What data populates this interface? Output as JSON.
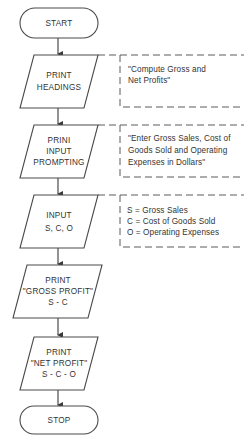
{
  "flowchart": {
    "nodes": [
      {
        "id": "start",
        "type": "terminal",
        "lines": [
          "START"
        ]
      },
      {
        "id": "print-headings",
        "type": "io",
        "lines": [
          "PRINT",
          "HEADINGS"
        ]
      },
      {
        "id": "print-input-prompting",
        "type": "io",
        "lines": [
          "PRINI",
          "INPUT",
          "PROMPTING"
        ]
      },
      {
        "id": "input-sco",
        "type": "io",
        "lines": [
          "INPUT",
          "S, C, O"
        ]
      },
      {
        "id": "print-gross-profit",
        "type": "io",
        "lines": [
          "PRINT",
          "\"GROSS PROFIT\"",
          "S - C"
        ]
      },
      {
        "id": "print-net-profit",
        "type": "io",
        "lines": [
          "PRINT",
          "\"NET PROFIT\"",
          "S - C - O"
        ]
      },
      {
        "id": "stop",
        "type": "terminal",
        "lines": [
          "STOP"
        ]
      }
    ],
    "edges": [
      [
        "start",
        "print-headings"
      ],
      [
        "print-headings",
        "print-input-prompting"
      ],
      [
        "print-input-prompting",
        "input-sco"
      ],
      [
        "input-sco",
        "print-gross-profit"
      ],
      [
        "print-gross-profit",
        "print-net-profit"
      ],
      [
        "print-net-profit",
        "stop"
      ]
    ],
    "annotations": [
      {
        "attached_to": "print-headings",
        "lines": [
          "\"Compute Gross and",
          "Net Profits\""
        ]
      },
      {
        "attached_to": "print-input-prompting",
        "lines": [
          "\"Enter Gross Sales, Cost of",
          "Goods Sold and Operating",
          "Expenses in Dollars\""
        ]
      },
      {
        "attached_to": "input-sco",
        "lines": [
          "S = Gross Sales",
          "C = Cost of Goods Sold",
          "O = Operating Expenses"
        ]
      }
    ]
  }
}
